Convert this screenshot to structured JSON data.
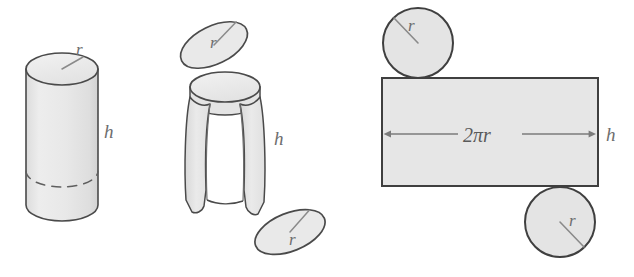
{
  "figure": {
    "background_color": "#ffffff",
    "palette": {
      "solid_fill": "#e9e9e9",
      "solid_fill_light": "#f0f0f0",
      "solid_fill_top": "#ececec",
      "stroke": "#4a4a4a",
      "stroke_soft": "#707070",
      "label_color": "#6e6e6e",
      "dash_color": "#5f5f5f",
      "arrow_color": "#7b7b7b",
      "rect_fill": "#e6e6e6",
      "circle_fill": "#e4e4e4"
    },
    "panels": [
      {
        "name": "closed-cylinder",
        "description": "Solid right circular cylinder drawn in perspective with hidden bottom ellipse dashed",
        "labels": [
          {
            "id": "radius",
            "text": "r"
          },
          {
            "id": "height",
            "text": "h"
          }
        ]
      },
      {
        "name": "exploded-cylinder",
        "description": "Cylinder with top and bottom disks detached and lateral surface opening up",
        "labels": [
          {
            "id": "radius-top",
            "text": "r"
          },
          {
            "id": "radius-bottom",
            "text": "r"
          },
          {
            "id": "height",
            "text": "h"
          }
        ]
      },
      {
        "name": "flattened-net",
        "description": "Net of the cylinder: two circular disks and the unrolled lateral rectangle",
        "labels": [
          {
            "id": "radius-top-circle",
            "text": "r"
          },
          {
            "id": "radius-bottom-circle",
            "text": "r"
          },
          {
            "id": "circumference",
            "text": "2πr"
          },
          {
            "id": "height",
            "text": "h"
          }
        ]
      }
    ],
    "labels": {
      "r": "r",
      "h": "h",
      "circumference": "2πr"
    }
  }
}
